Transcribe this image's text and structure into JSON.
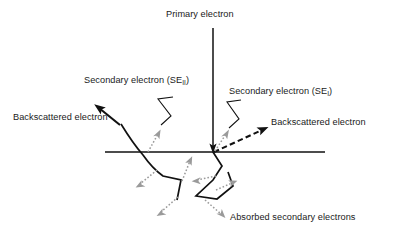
{
  "diagram": {
    "background_color": "#ffffff",
    "labels": {
      "primary_electron": "Primary electron",
      "secondary_electron_2_prefix": "Secondary electron (SE",
      "secondary_electron_2_sub": "II",
      "secondary_electron_2_suffix": ")",
      "secondary_electron_1_prefix": "Secondary electron (SE",
      "secondary_electron_1_sub": "I",
      "secondary_electron_1_suffix": ")",
      "backscattered_electron_left": "Backscattered electron",
      "backscattered_electron_right": "Backscattered electron",
      "absorbed_secondary_electrons": "Absorbed secondary electrons"
    },
    "colors": {
      "line_dark": "#111111",
      "secondary_gray": "#9a9a9a",
      "text": "#1a1a1a",
      "background": "#ffffff"
    },
    "geometry": {
      "surface_line_y": 152,
      "surface_line_x_start": 105,
      "surface_line_x_end": 325,
      "impact_point_x": 213,
      "impact_point_y": 152,
      "primary_beam_top_y": 28
    },
    "elements": {
      "primary_beam": "vertical-arrow-downward",
      "surface": "horizontal-specimen-surface-line",
      "left_trajectory": "scattering-path-left",
      "right_trajectory": "scattering-path-right",
      "backscattered_left_style": "solid-arrow",
      "backscattered_right_style": "dashed-arrow",
      "secondary_electron_style": "gray-dotted-arrow"
    }
  }
}
